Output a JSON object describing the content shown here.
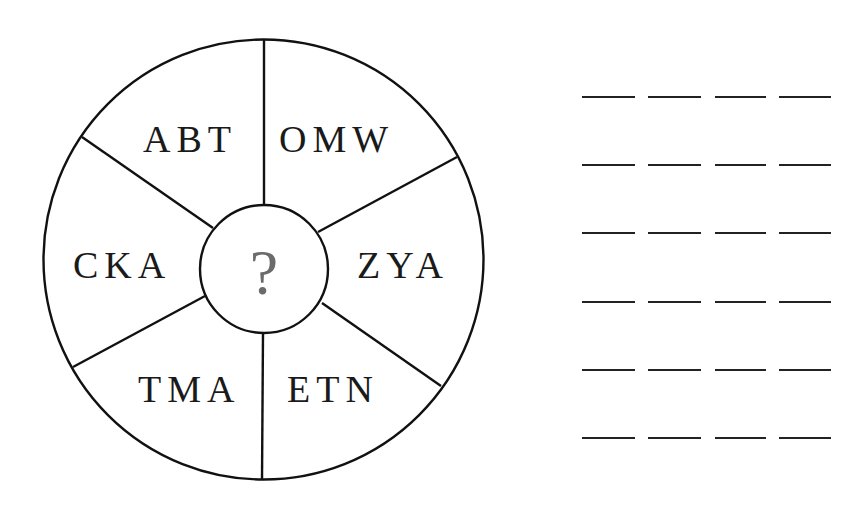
{
  "puzzle": {
    "center_symbol": "?",
    "segments": [
      {
        "position": "top-left",
        "letters": "ABT"
      },
      {
        "position": "top-right",
        "letters": "OMW"
      },
      {
        "position": "right",
        "letters": "ZYA"
      },
      {
        "position": "bottom-right",
        "letters": "ETN"
      },
      {
        "position": "bottom-left",
        "letters": "TMA"
      },
      {
        "position": "left",
        "letters": "CKA"
      }
    ],
    "answer_blanks": {
      "rows": 6,
      "blanks_per_row": 4
    }
  },
  "colors": {
    "line": "#111111",
    "text": "#1a1a1a",
    "question_mark": "#6b6b6b",
    "background": "#ffffff"
  }
}
